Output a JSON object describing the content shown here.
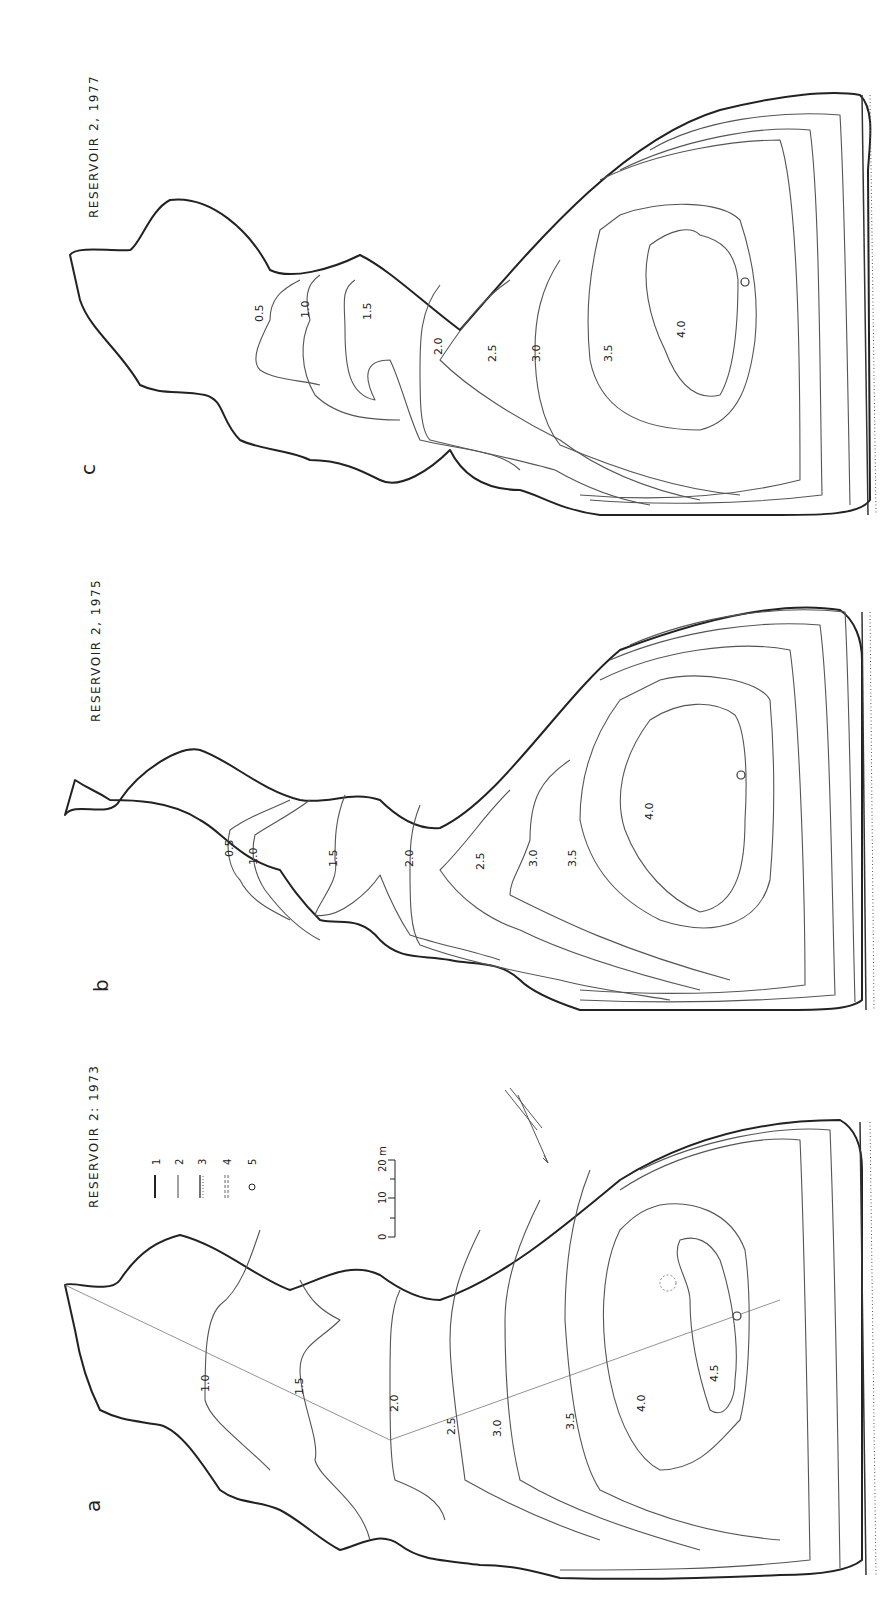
{
  "figure": {
    "orientation": "rotated 90 degrees counter-clockwise",
    "panels": [
      {
        "id": "a",
        "label": "a",
        "title": "RESERVOIR 2: 1973",
        "contour_labels": [
          "1.0",
          "1.5",
          "2.0",
          "2.5",
          "3.0",
          "3.5",
          "4.0",
          "4.5"
        ],
        "has_transect": true,
        "has_arrow": true
      },
      {
        "id": "b",
        "label": "b",
        "title": "RESERVOIR 2, 1975",
        "contour_labels": [
          "0.5",
          "1.0",
          "1.5",
          "2.0",
          "2.5",
          "3.0",
          "3.5",
          "4.0"
        ]
      },
      {
        "id": "c",
        "label": "c",
        "title": "RESERVOIR 2, 1977",
        "contour_labels": [
          "0.5",
          "1.0",
          "1.5",
          "2.0",
          "2.5",
          "3.0",
          "3.5",
          "4.0"
        ]
      }
    ],
    "legend": {
      "items": [
        {
          "num": "1",
          "symbol": "thick-line"
        },
        {
          "num": "2",
          "symbol": "thin-line"
        },
        {
          "num": "3",
          "symbol": "hatched-line"
        },
        {
          "num": "4",
          "symbol": "dashed-double-line"
        },
        {
          "num": "5",
          "symbol": "circle"
        }
      ]
    },
    "scale_bar": {
      "ticks": [
        "0",
        "10",
        "20 m"
      ]
    }
  }
}
